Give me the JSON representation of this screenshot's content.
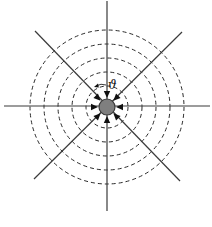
{
  "diagram": {
    "title": "",
    "center": {
      "x": 107,
      "y": 107
    },
    "center_disc": {
      "radius": 8,
      "fill": "#7f7f7f",
      "stroke": "#3a3a3a"
    },
    "dashed_circles": {
      "radii": [
        21,
        35,
        49,
        63,
        77
      ],
      "stroke": "#2a2a2a"
    },
    "radial_lines": [
      {
        "name": "vertical",
        "x1": 107,
        "y1": 1,
        "x2": 107,
        "y2": 211
      },
      {
        "name": "horizontal",
        "x1": 4,
        "y1": 106,
        "x2": 210,
        "y2": 106
      },
      {
        "name": "diagonal-tl-br",
        "x1": 35,
        "y1": 31,
        "x2": 180,
        "y2": 181
      },
      {
        "name": "diagonal-tr-bl",
        "x1": 182,
        "y1": 32,
        "x2": 34,
        "y2": 179
      }
    ],
    "inward_arrows": {
      "count": 8,
      "angles_deg": [
        0,
        45,
        90,
        135,
        180,
        225,
        270,
        315
      ],
      "color": "#111111"
    },
    "angle_label": {
      "text": "ϑ",
      "x": 108,
      "y": 89
    },
    "angle_arc_arrow": {
      "direction": "counterclockwise"
    }
  }
}
